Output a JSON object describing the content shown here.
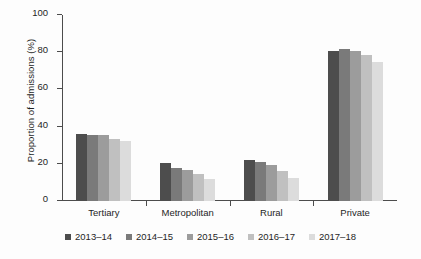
{
  "chart_data": {
    "type": "bar",
    "title": "",
    "xlabel": "",
    "ylabel": "Proportion of admissions (%)",
    "categories": [
      "Tertiary",
      "Metropolitan",
      "Rural",
      "Private"
    ],
    "ylim": [
      0,
      100
    ],
    "yticks": [
      0,
      20,
      40,
      60,
      80,
      100
    ],
    "ytick_labels": [
      "0",
      "20",
      "40",
      "60",
      "80",
      "100"
    ],
    "grid": false,
    "legend_position": "bottom",
    "series": [
      {
        "name": "2013–14",
        "color": "#4d4d4d",
        "values": [
          36.0,
          20.5,
          22.0,
          80.5
        ]
      },
      {
        "name": "2014–15",
        "color": "#7a7a7a",
        "values": [
          35.5,
          18.0,
          21.0,
          81.5
        ]
      },
      {
        "name": "2015–16",
        "color": "#9c9c9c",
        "values": [
          35.5,
          16.5,
          19.5,
          80.5
        ]
      },
      {
        "name": "2016–17",
        "color": "#c0c0c0",
        "values": [
          33.5,
          14.5,
          16.0,
          78.5
        ]
      },
      {
        "name": "2017–18",
        "color": "#dcdcdc",
        "values": [
          32.5,
          12.0,
          12.5,
          74.5
        ]
      }
    ]
  },
  "axis": {
    "y_title": "Proportion of admissions (%)",
    "tick_labels": [
      "100",
      "80",
      "60",
      "40",
      "20",
      "0"
    ]
  },
  "legend": {
    "items": [
      {
        "label": "2013–14",
        "color": "#4d4d4d"
      },
      {
        "label": "2014–15",
        "color": "#7a7a7a"
      },
      {
        "label": "2015–16",
        "color": "#9c9c9c"
      },
      {
        "label": "2016–17",
        "color": "#c0c0c0"
      },
      {
        "label": "2017–18",
        "color": "#dcdcdc"
      }
    ]
  }
}
